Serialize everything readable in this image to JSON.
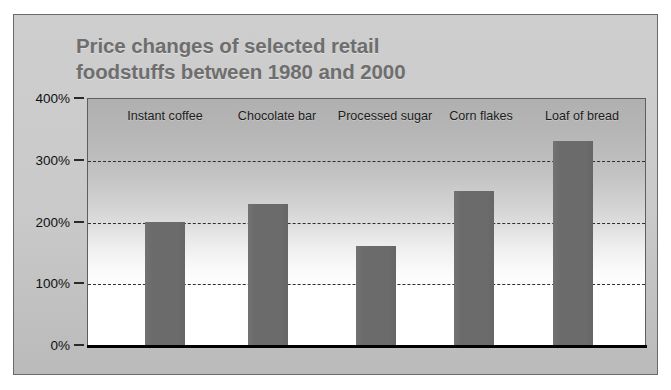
{
  "chart_data": {
    "type": "bar",
    "title": "Price changes of selected retail foodstuffs between 1980 and 2000",
    "title_line1": "Price changes of selected retail",
    "title_line2": "foodstuffs between 1980 and 2000",
    "categories": [
      "Instant coffee",
      "Chocolate bar",
      "Processed sugar",
      "Corn flakes",
      "Loaf of bread"
    ],
    "values": [
      200,
      228,
      160,
      250,
      330
    ],
    "value_labels": [
      "200%",
      "228%",
      "160%",
      "250%",
      "330%"
    ],
    "xlabel": "",
    "ylabel": "",
    "ylim": [
      0,
      400
    ],
    "ytick_values": [
      0,
      100,
      200,
      300,
      400
    ],
    "ytick_labels": [
      "0%",
      "100%",
      "200%",
      "300%",
      "400%"
    ],
    "gridlines_at": [
      100,
      200,
      300
    ],
    "grid": true,
    "grid_style": "dashed",
    "legend": false,
    "legend_position": "none",
    "bar_color": "#6b6b6b",
    "plot_background": "gradient-gray-to-white",
    "title_color": "#6e6e6e",
    "axis_color": "#000000",
    "card_color": "#c9c9c9"
  },
  "axis": {
    "y_ticks": [
      {
        "label": "400%",
        "value": 400
      },
      {
        "label": "300%",
        "value": 300
      },
      {
        "label": "200%",
        "value": 200
      },
      {
        "label": "100%",
        "value": 100
      },
      {
        "label": "0%",
        "value": 0
      }
    ]
  },
  "bars": [
    {
      "label": "Instant coffee",
      "value": 200
    },
    {
      "label": "Chocolate bar",
      "value": 228
    },
    {
      "label": "Processed sugar",
      "value": 160
    },
    {
      "label": "Corn flakes",
      "value": 250
    },
    {
      "label": "Loaf of bread",
      "value": 330
    }
  ]
}
